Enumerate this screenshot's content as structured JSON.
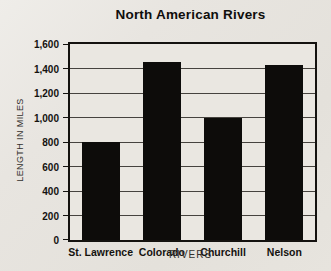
{
  "page": {
    "background": "#e7e4de"
  },
  "chart_data": {
    "type": "bar",
    "title": "North American Rivers",
    "categories": [
      "St. Lawrence",
      "Colorado",
      "Churchill",
      "Nelson"
    ],
    "values": [
      800,
      1450,
      1000,
      1430
    ],
    "xlabel": "RIVERS",
    "ylabel": "LENGTH IN MILES",
    "ylim": [
      0,
      1600
    ],
    "ytick_step": 200,
    "ytick_labels": [
      "0",
      "200",
      "400",
      "600",
      "800",
      "1,000",
      "1,200",
      "1,400",
      "1,600"
    ],
    "grid": true,
    "legend_position": "none",
    "bar_color": "#0d0c0a",
    "bar_width_px": 38
  }
}
